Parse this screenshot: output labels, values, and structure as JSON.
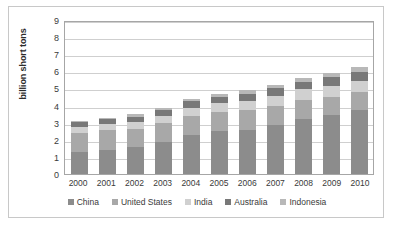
{
  "chart_data": {
    "type": "bar",
    "stacked": true,
    "title": "",
    "xlabel": "",
    "ylabel": "billion short tons",
    "ylim": [
      0,
      9
    ],
    "ytick_labels": [
      "0",
      "1",
      "2",
      "3",
      "4",
      "5",
      "6",
      "7",
      "8",
      "9"
    ],
    "yticks": [
      0,
      1,
      2,
      3,
      4,
      5,
      6,
      7,
      8,
      9
    ],
    "grid": true,
    "legend_position": "bottom",
    "categories": [
      "2000",
      "2001",
      "2002",
      "2003",
      "2004",
      "2005",
      "2006",
      "2007",
      "2008",
      "2009",
      "2010"
    ],
    "series": [
      {
        "name": "China",
        "color": "#8c8c8c",
        "values": [
          1.3,
          1.4,
          1.55,
          1.9,
          2.3,
          2.5,
          2.6,
          2.85,
          3.2,
          3.45,
          3.75
        ]
      },
      {
        "name": "United States",
        "color": "#a8a8a8",
        "values": [
          1.1,
          1.15,
          1.1,
          1.1,
          1.1,
          1.15,
          1.15,
          1.15,
          1.15,
          1.05,
          1.05
        ]
      },
      {
        "name": "India",
        "color": "#d0d0d0",
        "values": [
          0.35,
          0.35,
          0.38,
          0.4,
          0.45,
          0.48,
          0.5,
          0.55,
          0.6,
          0.65,
          0.63
        ]
      },
      {
        "name": "Australia",
        "color": "#787878",
        "values": [
          0.27,
          0.3,
          0.33,
          0.35,
          0.4,
          0.4,
          0.42,
          0.45,
          0.45,
          0.5,
          0.52
        ]
      },
      {
        "name": "Indonesia",
        "color": "#b8b8b8",
        "values": [
          0.08,
          0.1,
          0.14,
          0.13,
          0.15,
          0.17,
          0.22,
          0.22,
          0.2,
          0.23,
          0.3
        ]
      }
    ],
    "totals": [
      3.1,
      3.3,
      3.5,
      3.88,
      4.4,
      4.7,
      4.89,
      5.22,
      5.6,
      5.88,
      6.25
    ]
  },
  "axis": {
    "y_title": "billion short tons"
  }
}
